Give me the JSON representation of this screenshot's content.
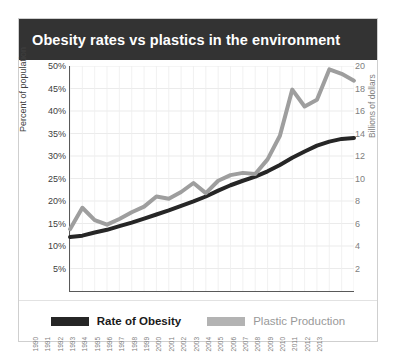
{
  "chart": {
    "title": "Obesity rates vs plastics in the environment",
    "title_bg": "#333333",
    "title_color": "#ffffff"
  },
  "chart_data": {
    "type": "line",
    "title": "Obesity rates vs plastics in the environment",
    "xlabel": "",
    "ylabel": "Percent of population",
    "y2label": "Billions of dollars",
    "grid": true,
    "legend_position": "bottom",
    "ylim": [
      0,
      50
    ],
    "y2lim": [
      0,
      20
    ],
    "yticks": [
      "5%",
      "10%",
      "15%",
      "20%",
      "25%",
      "30%",
      "35%",
      "40%",
      "45%",
      "50%"
    ],
    "ytick_values": [
      5,
      10,
      15,
      20,
      25,
      30,
      35,
      40,
      45,
      50
    ],
    "y2ticks": [
      "2",
      "4",
      "6",
      "8",
      "10",
      "12",
      "14",
      "16",
      "18",
      "20"
    ],
    "y2tick_values": [
      2,
      4,
      6,
      8,
      10,
      12,
      14,
      16,
      18,
      20
    ],
    "categories": [
      "1990",
      "1991",
      "1992",
      "1993",
      "1994",
      "1995",
      "1996",
      "1997",
      "1998",
      "1999",
      "2000",
      "2001",
      "2002",
      "2003",
      "2004",
      "2005",
      "2006",
      "2007",
      "2008",
      "2009",
      "2010",
      "2011",
      "2012",
      "2013"
    ],
    "series": [
      {
        "name": "Rate of Obesity",
        "axis": "left",
        "unit": "percent",
        "color": "#262626",
        "values": [
          12.0,
          12.3,
          13.0,
          13.6,
          14.4,
          15.2,
          16.1,
          17.0,
          17.9,
          18.9,
          19.9,
          21.0,
          22.3,
          23.5,
          24.5,
          25.4,
          26.6,
          28.0,
          29.6,
          31.0,
          32.3,
          33.2,
          33.8,
          34.0
        ]
      },
      {
        "name": "Plastic Production",
        "axis": "right",
        "unit": "billions_of_dollars",
        "color": "#9e9e9e",
        "values": [
          5.5,
          7.4,
          6.3,
          5.9,
          6.4,
          7.0,
          7.5,
          8.4,
          8.2,
          8.8,
          9.6,
          8.7,
          9.8,
          10.3,
          10.5,
          10.4,
          11.7,
          13.8,
          17.9,
          16.4,
          17.0,
          19.7,
          19.3,
          18.7
        ]
      }
    ]
  },
  "legend": {
    "items": [
      {
        "label": "Rate of Obesity",
        "color": "#262626"
      },
      {
        "label": "Plastic Production",
        "color": "#b3b3b3"
      }
    ]
  }
}
